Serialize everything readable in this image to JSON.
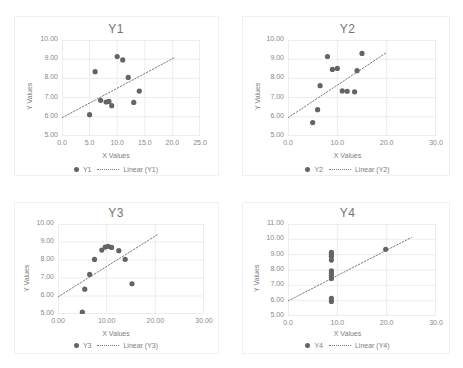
{
  "figure": {
    "background": "#ffffff",
    "marker_color": "#646464",
    "grid_color": "#ededed",
    "text_color": "#7d7d7d",
    "trend_color": "#7a7a7a"
  },
  "panels": [
    {
      "key": "y1",
      "title": "Y1",
      "xlabel": "X Values",
      "ylabel": "Y Values",
      "legend": {
        "series_label": "Y1",
        "trend_label": "Linear (Y1)"
      },
      "xticks": [
        "0.0",
        "5.0",
        "10.0",
        "15.0",
        "20.0",
        "25.0"
      ],
      "yticks": [
        "5.00",
        "6.00",
        "7.00",
        "8.00",
        "9.00",
        "10.00"
      ]
    },
    {
      "key": "y2",
      "title": "Y2",
      "xlabel": "X Values",
      "ylabel": "Y Values",
      "legend": {
        "series_label": "Y2",
        "trend_label": "Linear (Y2)"
      },
      "xticks": [
        "0.0",
        "10.0",
        "20.0",
        "30.0"
      ],
      "yticks": [
        "5.00",
        "6.00",
        "7.00",
        "8.00",
        "9.00",
        "10.00"
      ]
    },
    {
      "key": "y3",
      "title": "Y3",
      "xlabel": "X Values",
      "ylabel": "Y Values",
      "legend": {
        "series_label": "Y3",
        "trend_label": "Linear (Y3)"
      },
      "xticks": [
        "0.00",
        "10.00",
        "20.00",
        "30.00"
      ],
      "yticks": [
        "5.00",
        "6.00",
        "7.00",
        "8.00",
        "9.00",
        "10.00"
      ]
    },
    {
      "key": "y4",
      "title": "Y4",
      "xlabel": "X Values",
      "ylabel": "Y Values",
      "legend": {
        "series_label": "Y4",
        "trend_label": "Linear (Y4)"
      },
      "xticks": [
        "0.0",
        "10.0",
        "20.0",
        "30.0"
      ],
      "yticks": [
        "5.00",
        "6.00",
        "7.00",
        "8.00",
        "9.00",
        "10.00",
        "11.00"
      ]
    }
  ],
  "chart_data": [
    {
      "type": "scatter",
      "title": "Y1",
      "xlabel": "X Values",
      "ylabel": "Y Values",
      "xlim": [
        0.0,
        25.0
      ],
      "ylim": [
        5.0,
        10.0
      ],
      "xticks": [
        0.0,
        5.0,
        10.0,
        15.0,
        20.0,
        25.0
      ],
      "yticks": [
        5.0,
        6.0,
        7.0,
        8.0,
        9.0,
        10.0
      ],
      "grid": true,
      "legend_position": "bottom",
      "legend": [
        "Y1",
        "Linear (Y1)"
      ],
      "series": [
        {
          "name": "Y1",
          "x": [
            10.0,
            8.0,
            13.0,
            9.0,
            11.0,
            14.0,
            6.0,
            12.0,
            7.0,
            5.0,
            8.5
          ],
          "y": [
            9.14,
            6.77,
            6.75,
            6.58,
            8.96,
            7.34,
            8.35,
            8.05,
            6.86,
            6.11,
            6.8
          ]
        }
      ],
      "trendline": {
        "name": "Linear (Y1)",
        "x": [
          0.0,
          20.5
        ],
        "y": [
          5.95,
          9.1
        ],
        "style": "dotted"
      }
    },
    {
      "type": "scatter",
      "title": "Y2",
      "xlabel": "X Values",
      "ylabel": "Y Values",
      "xlim": [
        0.0,
        30.0
      ],
      "ylim": [
        5.0,
        10.0
      ],
      "xticks": [
        0.0,
        10.0,
        20.0,
        30.0
      ],
      "yticks": [
        5.0,
        6.0,
        7.0,
        8.0,
        9.0,
        10.0
      ],
      "grid": true,
      "legend_position": "bottom",
      "legend": [
        "Y2",
        "Linear (Y2)"
      ],
      "series": [
        {
          "name": "Y2",
          "x": [
            8.0,
            9.0,
            10.0,
            12.0,
            14.0,
            15.0,
            6.5,
            11.0,
            13.5,
            6.0,
            5.0
          ],
          "y": [
            9.14,
            8.47,
            8.52,
            7.33,
            8.4,
            9.3,
            7.62,
            7.35,
            7.3,
            6.37,
            5.7
          ]
        }
      ],
      "trendline": {
        "name": "Linear (Y2)",
        "x": [
          0.0,
          20.0
        ],
        "y": [
          5.95,
          9.35
        ],
        "style": "dotted"
      }
    },
    {
      "type": "scatter",
      "title": "Y3",
      "xlabel": "X Values",
      "ylabel": "Y Values",
      "xlim": [
        0.0,
        30.0
      ],
      "ylim": [
        5.0,
        10.0
      ],
      "xticks": [
        0.0,
        10.0,
        20.0,
        30.0
      ],
      "yticks": [
        5.0,
        6.0,
        7.0,
        8.0,
        9.0,
        10.0
      ],
      "grid": true,
      "legend_position": "bottom",
      "legend": [
        "Y3",
        "Linear (Y3)"
      ],
      "series": [
        {
          "name": "Y3",
          "x": [
            5.0,
            5.5,
            6.5,
            7.5,
            9.0,
            9.7,
            10.3,
            11.0,
            12.5,
            13.8,
            15.2
          ],
          "y": [
            5.1,
            6.38,
            7.2,
            8.03,
            8.55,
            8.72,
            8.76,
            8.7,
            8.52,
            8.04,
            6.68
          ]
        }
      ],
      "trendline": {
        "name": "Linear (Y3)",
        "x": [
          0.0,
          20.5
        ],
        "y": [
          5.95,
          9.42
        ],
        "style": "dotted"
      }
    },
    {
      "type": "scatter",
      "title": "Y4",
      "xlabel": "X Values",
      "ylabel": "Y Values",
      "xlim": [
        0.0,
        30.0
      ],
      "ylim": [
        5.0,
        11.0
      ],
      "xticks": [
        0.0,
        10.0,
        20.0,
        30.0
      ],
      "yticks": [
        5.0,
        6.0,
        7.0,
        8.0,
        9.0,
        10.0,
        11.0
      ],
      "grid": true,
      "legend_position": "bottom",
      "legend": [
        "Y4",
        "Linear (Y4)"
      ],
      "series": [
        {
          "name": "Y4",
          "x": [
            8.8,
            8.8,
            8.8,
            8.8,
            8.8,
            8.8,
            8.8,
            8.8,
            8.8,
            8.8,
            19.8
          ],
          "y": [
            5.95,
            6.15,
            7.45,
            7.65,
            7.8,
            7.95,
            8.65,
            8.9,
            9.05,
            9.15,
            9.35
          ]
        }
      ],
      "trendline": {
        "name": "Linear (Y4)",
        "x": [
          0.0,
          25.0
        ],
        "y": [
          5.98,
          10.12
        ],
        "style": "dotted"
      }
    }
  ]
}
